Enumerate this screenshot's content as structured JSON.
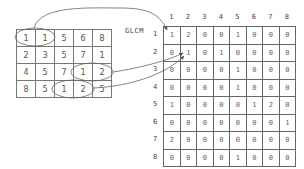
{
  "image_matrix": {
    "rows": [
      [
        "1",
        "1",
        "5",
        "6",
        "8"
      ],
      [
        "2",
        "3",
        "5",
        "7",
        "1"
      ],
      [
        "4",
        "5",
        "7",
        "1",
        "2"
      ],
      [
        "8",
        "5",
        "1",
        "2",
        "5"
      ]
    ]
  },
  "glcm": {
    "label": "GLCM",
    "col_labels": [
      "1",
      "2",
      "3",
      "4",
      "5",
      "6",
      "7",
      "8"
    ],
    "row_labels": [
      "1",
      "2",
      "3",
      "4",
      "5",
      "6",
      "7",
      "8"
    ],
    "rows": [
      [
        "1",
        "2",
        "0",
        "0",
        "1",
        "0",
        "0",
        "0"
      ],
      [
        "0",
        "1",
        "0",
        "1",
        "0",
        "0",
        "0",
        "0"
      ],
      [
        "0",
        "0",
        "0",
        "0",
        "1",
        "0",
        "0",
        "0"
      ],
      [
        "0",
        "0",
        "0",
        "0",
        "1",
        "0",
        "0",
        "0"
      ],
      [
        "1",
        "0",
        "0",
        "0",
        "0",
        "1",
        "2",
        "0"
      ],
      [
        "0",
        "0",
        "0",
        "0",
        "0",
        "0",
        "0",
        "1"
      ],
      [
        "2",
        "0",
        "0",
        "0",
        "0",
        "0",
        "0",
        "0"
      ],
      [
        "0",
        "0",
        "0",
        "0",
        "1",
        "0",
        "0",
        "0"
      ]
    ]
  },
  "annotations": {
    "circled_pairs": [
      {
        "pair": "(1,1)",
        "maps_to": "GLCM[1][1]"
      },
      {
        "pair": "(1,2)",
        "maps_to": "GLCM[1][2]"
      },
      {
        "pair": "(1,2)",
        "maps_to": "GLCM[1][2]"
      }
    ]
  },
  "colors": {
    "grid_line": "#777777",
    "text": "#555555",
    "arrow": "#666666"
  }
}
